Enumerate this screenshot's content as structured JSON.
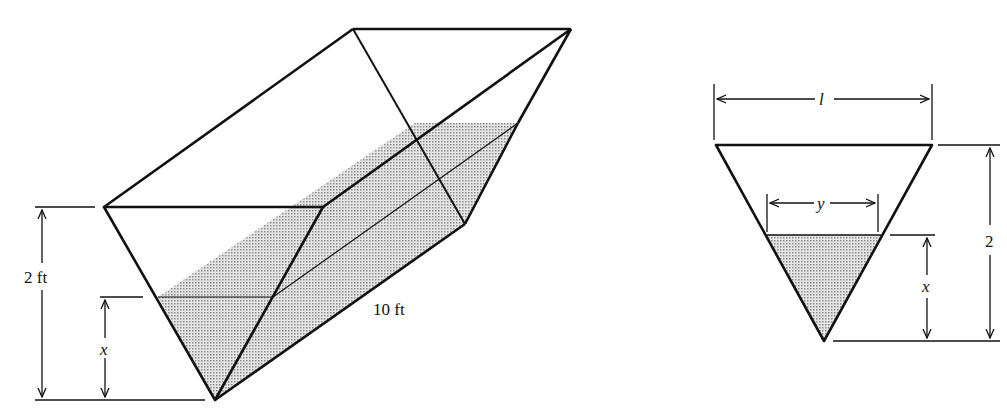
{
  "figure": {
    "left": {
      "description": "Trough with triangular cross-section partially filled with water",
      "labels": {
        "height": "2 ft",
        "water_depth": "x",
        "length": "10 ft"
      }
    },
    "right": {
      "description": "Triangular cross-section of trough",
      "labels": {
        "top_width": "l",
        "water_width": "y",
        "water_depth": "x",
        "height": "2"
      }
    },
    "colors": {
      "line": "#111111",
      "water_fill": "#bdbdbd"
    }
  }
}
